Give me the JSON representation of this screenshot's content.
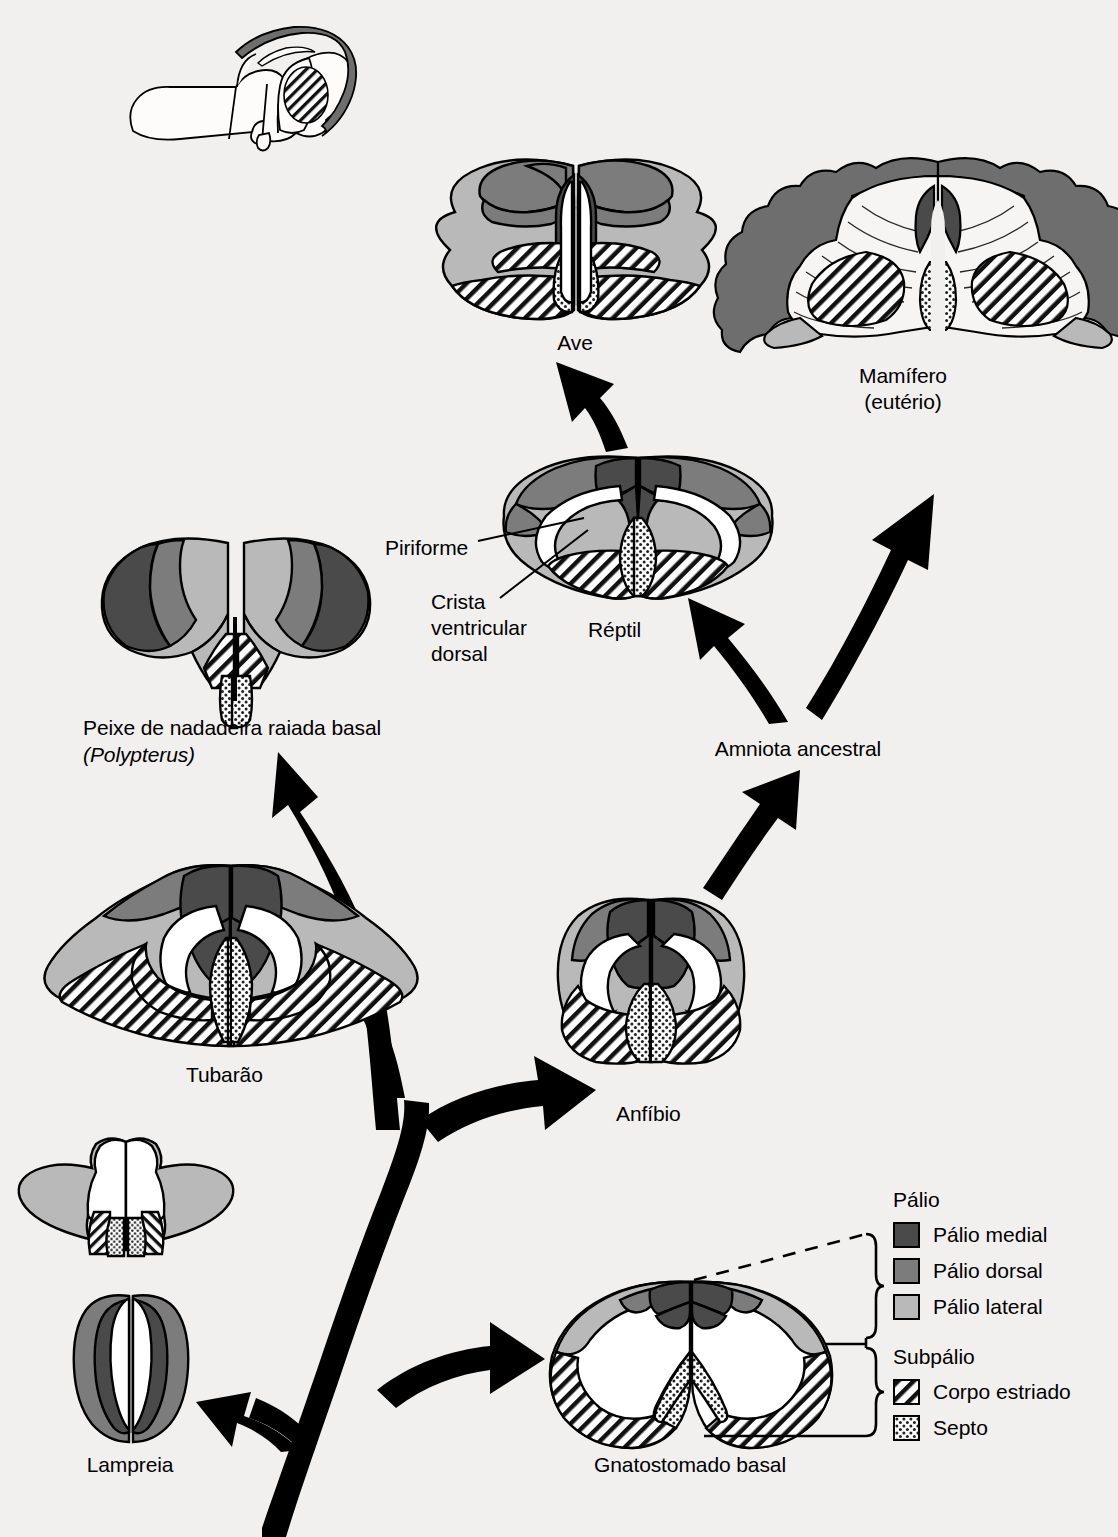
{
  "figure": {
    "type": "comparative-neuroanatomy-phylogeny",
    "language": "pt-BR",
    "background": "#f2f0ee"
  },
  "colors": {
    "palio_medial": "#4a4a4a",
    "palio_dorsal": "#7c7c7c",
    "palio_lateral": "#b9b9b9",
    "corpo_estriado": "#ffffff",
    "septo": "#ffffff",
    "outline": "#000000",
    "arrow": "#000000",
    "white_matter": "#f7f5f3"
  },
  "taxa": [
    {
      "id": "ave",
      "label": "Ave",
      "x": 575,
      "y": 330
    },
    {
      "id": "mamifero",
      "label": "Mamífero",
      "label2": "(eutério)",
      "x": 903,
      "y": 363
    },
    {
      "id": "reptil",
      "label": "Réptil",
      "x": 618,
      "y": 617
    },
    {
      "id": "polypterus",
      "label": "Peixe de nadadeira raiada basal",
      "label2": "(Polypterus)",
      "x": 83,
      "y": 715
    },
    {
      "id": "amniota",
      "label": "Amniota ancestral",
      "x": 798,
      "y": 736
    },
    {
      "id": "tubarao",
      "label": "Tubarão",
      "x": 230,
      "y": 1062
    },
    {
      "id": "anfibio",
      "label": "Anfíbio",
      "x": 650,
      "y": 1101
    },
    {
      "id": "lampreia",
      "label": "Lampreia",
      "x": 130,
      "y": 1463
    },
    {
      "id": "gnatostomado",
      "label": "Gnatostomado basal",
      "x": 690,
      "y": 1463
    }
  ],
  "annotations": [
    {
      "id": "piriforme",
      "label": "Piriforme",
      "x": 385,
      "y": 535
    },
    {
      "id": "crista",
      "label": "Crista",
      "label2": "ventricular",
      "label3": "dorsal",
      "x": 431,
      "y": 589
    }
  ],
  "legend": {
    "group1": {
      "title": "Pálio",
      "items": [
        {
          "id": "palio-medial",
          "label": "Pálio medial",
          "fill": "#4a4a4a",
          "pattern": "solid"
        },
        {
          "id": "palio-dorsal",
          "label": "Pálio dorsal",
          "fill": "#7c7c7c",
          "pattern": "solid"
        },
        {
          "id": "palio-lateral",
          "label": "Pálio lateral",
          "fill": "#b9b9b9",
          "pattern": "solid"
        }
      ]
    },
    "group2": {
      "title": "Subpálio",
      "items": [
        {
          "id": "corpo-estriado",
          "label": "Corpo estriado",
          "fill": "#ffffff",
          "pattern": "diagonal-hatch"
        },
        {
          "id": "septo",
          "label": "Septo",
          "fill": "#ffffff",
          "pattern": "stipple"
        }
      ]
    }
  }
}
